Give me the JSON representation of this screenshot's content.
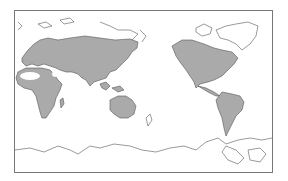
{
  "map": {
    "projection": "equirectangular, Pacific-centered",
    "colors": {
      "background": "#ffffff",
      "frame": "#777777",
      "coastline": "#555555",
      "shaded_region": "#aaaaaa"
    },
    "shaded_regions": [
      "Eurasia",
      "Africa",
      "Australia",
      "North America",
      "Central America",
      "South America"
    ],
    "unshaded_regions": [
      "Sahara",
      "Arabian desert",
      "Arctic",
      "Greenland",
      "Antarctica"
    ]
  }
}
